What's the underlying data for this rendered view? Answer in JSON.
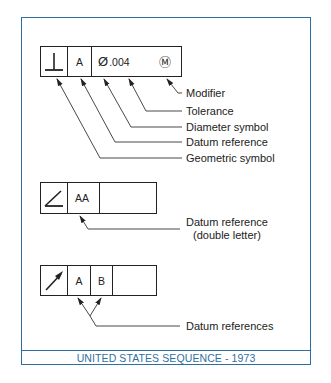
{
  "footer": {
    "text": "UNITED STATES SEQUENCE - 1973"
  },
  "colors": {
    "frame": "#2f6f9f",
    "ink": "#222222"
  },
  "frames": [
    {
      "name": "perpendicularity-frame",
      "cells": [
        {
          "type": "symbol",
          "symbol": "perpendicularity-icon",
          "text": ""
        },
        {
          "type": "datum",
          "text": "A"
        },
        {
          "type": "tolerance",
          "diameter": "Ø",
          "text": ".004",
          "modifier": "Ⓜ"
        }
      ]
    },
    {
      "name": "angularity-frame",
      "cells": [
        {
          "type": "symbol",
          "symbol": "angularity-icon",
          "text": ""
        },
        {
          "type": "datum",
          "text": "AA"
        },
        {
          "type": "empty",
          "text": ""
        }
      ]
    },
    {
      "name": "runout-frame",
      "cells": [
        {
          "type": "symbol",
          "symbol": "circular-runout-icon",
          "text": ""
        },
        {
          "type": "datum",
          "text": "A"
        },
        {
          "type": "datum",
          "text": "B"
        },
        {
          "type": "empty",
          "text": ""
        }
      ]
    }
  ],
  "labels": {
    "modifier": "Modifier",
    "tolerance": "Tolerance",
    "diameter_symbol": "Diameter symbol",
    "datum_reference": "Datum reference",
    "geometric_symbol": "Geometric symbol",
    "datum_reference_double": "Datum reference",
    "double_letter": "(double letter)",
    "datum_references": "Datum references"
  }
}
